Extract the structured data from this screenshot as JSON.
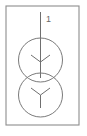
{
  "diagram": {
    "kind": "single-line-diagram",
    "background_color": "#ffffff",
    "frame": {
      "name": "outer-border",
      "stroke_color": "#8d8d8d",
      "x": 6,
      "y": 6,
      "width": 73,
      "height": 119
    },
    "labels": [
      {
        "id": "terminal-label-1",
        "text": "1",
        "x": 46,
        "y": 22,
        "color": "#6a6a6a"
      }
    ],
    "lines": [
      {
        "id": "incoming-conductor",
        "x1": 40.5,
        "y1": 12,
        "x2": 40.5,
        "y2": 78,
        "color": "#6f6f6f"
      }
    ],
    "windings": [
      {
        "id": "winding-primary",
        "shape": "circle",
        "cx": 40.5,
        "cy": 60,
        "r": 22,
        "connection": "wye",
        "connection_symbol": "Y",
        "color": "#7a7a7a"
      },
      {
        "id": "winding-secondary",
        "shape": "circle",
        "cx": 40.5,
        "cy": 95,
        "r": 22,
        "connection": "wye",
        "connection_symbol": "Y",
        "color": "#7a7a7a"
      }
    ],
    "wye_symbols": [
      {
        "id": "wye-primary",
        "center_x": 40.5,
        "center_y": 62,
        "arm_left_x": 31,
        "arm_left_y": 55,
        "arm_right_x": 50,
        "arm_right_y": 55,
        "stem_end_y": 71,
        "color": "#6f6f6f"
      },
      {
        "id": "wye-secondary",
        "center_x": 40.5,
        "center_y": 95,
        "arm_left_x": 31,
        "arm_left_y": 88,
        "arm_right_x": 50,
        "arm_right_y": 88,
        "stem_end_y": 108,
        "color": "#6f6f6f"
      }
    ]
  }
}
